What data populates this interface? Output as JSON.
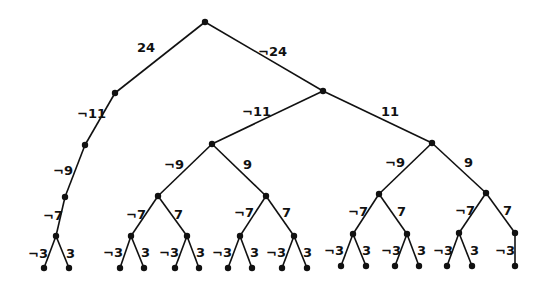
{
  "diagram": {
    "type": "binary-tree",
    "nodes": [
      {
        "id": "root",
        "x": 205,
        "y": 22
      },
      {
        "id": "L",
        "x": 115,
        "y": 93
      },
      {
        "id": "R",
        "x": 323,
        "y": 91
      },
      {
        "id": "L1",
        "x": 85,
        "y": 145
      },
      {
        "id": "L2",
        "x": 65,
        "y": 197
      },
      {
        "id": "L3",
        "x": 56,
        "y": 236
      },
      {
        "id": "L3a",
        "x": 44,
        "y": 268
      },
      {
        "id": "L3b",
        "x": 69,
        "y": 268
      },
      {
        "id": "RA",
        "x": 212,
        "y": 144
      },
      {
        "id": "RB",
        "x": 432,
        "y": 143
      },
      {
        "id": "RA1",
        "x": 158,
        "y": 196
      },
      {
        "id": "RA2",
        "x": 266,
        "y": 196
      },
      {
        "id": "RA1a",
        "x": 131,
        "y": 236
      },
      {
        "id": "RA1b",
        "x": 187,
        "y": 236
      },
      {
        "id": "RA2a",
        "x": 240,
        "y": 236
      },
      {
        "id": "RA2b",
        "x": 294,
        "y": 236
      },
      {
        "id": "RB1",
        "x": 379,
        "y": 194
      },
      {
        "id": "RB2",
        "x": 486,
        "y": 193
      },
      {
        "id": "RB1a",
        "x": 353,
        "y": 234
      },
      {
        "id": "RB1b",
        "x": 407,
        "y": 234
      },
      {
        "id": "RB2a",
        "x": 459,
        "y": 233
      },
      {
        "id": "RB2b",
        "x": 515,
        "y": 233
      },
      {
        "id": "f1",
        "x": 120,
        "y": 268
      },
      {
        "id": "f2",
        "x": 144,
        "y": 268
      },
      {
        "id": "f3",
        "x": 175,
        "y": 268
      },
      {
        "id": "f4",
        "x": 199,
        "y": 268
      },
      {
        "id": "f5",
        "x": 228,
        "y": 268
      },
      {
        "id": "f6",
        "x": 252,
        "y": 268
      },
      {
        "id": "f7",
        "x": 282,
        "y": 268
      },
      {
        "id": "f8",
        "x": 307,
        "y": 268
      },
      {
        "id": "f9",
        "x": 341,
        "y": 266
      },
      {
        "id": "f10",
        "x": 366,
        "y": 266
      },
      {
        "id": "f11",
        "x": 395,
        "y": 266
      },
      {
        "id": "f12",
        "x": 419,
        "y": 266
      },
      {
        "id": "f13",
        "x": 447,
        "y": 266
      },
      {
        "id": "f14",
        "x": 472,
        "y": 266
      },
      {
        "id": "f15",
        "x": 515,
        "y": 266
      }
    ],
    "edges": [
      {
        "from": "root",
        "to": "L",
        "label": "24",
        "lx": 137,
        "ly": 52
      },
      {
        "from": "root",
        "to": "R",
        "label": "¬24",
        "lx": 258,
        "ly": 56
      },
      {
        "from": "L",
        "to": "L1",
        "label": "¬11",
        "lx": 77,
        "ly": 118
      },
      {
        "from": "L1",
        "to": "L2",
        "label": "¬9",
        "lx": 53,
        "ly": 175
      },
      {
        "from": "L2",
        "to": "L3",
        "label": "¬7",
        "lx": 43,
        "ly": 220
      },
      {
        "from": "L3",
        "to": "L3a",
        "label": "¬3",
        "lx": 28,
        "ly": 258
      },
      {
        "from": "L3",
        "to": "L3b",
        "label": "3",
        "lx": 66,
        "ly": 258
      },
      {
        "from": "R",
        "to": "RA",
        "label": "¬11",
        "lx": 242,
        "ly": 116
      },
      {
        "from": "R",
        "to": "RB",
        "label": "11",
        "lx": 381,
        "ly": 116
      },
      {
        "from": "RA",
        "to": "RA1",
        "label": "¬9",
        "lx": 164,
        "ly": 169
      },
      {
        "from": "RA",
        "to": "RA2",
        "label": "9",
        "lx": 243,
        "ly": 169
      },
      {
        "from": "RA1",
        "to": "RA1a",
        "label": "¬7",
        "lx": 126,
        "ly": 219
      },
      {
        "from": "RA1",
        "to": "RA1b",
        "label": "7",
        "lx": 174,
        "ly": 219
      },
      {
        "from": "RA2",
        "to": "RA2a",
        "label": "¬7",
        "lx": 234,
        "ly": 217
      },
      {
        "from": "RA2",
        "to": "RA2b",
        "label": "7",
        "lx": 282,
        "ly": 217
      },
      {
        "from": "RA1a",
        "to": "f1",
        "label": "¬3",
        "lx": 103,
        "ly": 257
      },
      {
        "from": "RA1a",
        "to": "f2",
        "label": "3",
        "lx": 141,
        "ly": 257
      },
      {
        "from": "RA1b",
        "to": "f3",
        "label": "¬3",
        "lx": 159,
        "ly": 257
      },
      {
        "from": "RA1b",
        "to": "f4",
        "label": "3",
        "lx": 196,
        "ly": 257
      },
      {
        "from": "RA2a",
        "to": "f5",
        "label": "¬3",
        "lx": 212,
        "ly": 257
      },
      {
        "from": "RA2a",
        "to": "f6",
        "label": "3",
        "lx": 250,
        "ly": 257
      },
      {
        "from": "RA2b",
        "to": "f7",
        "label": "¬3",
        "lx": 266,
        "ly": 257
      },
      {
        "from": "RA2b",
        "to": "f8",
        "label": "3",
        "lx": 303,
        "ly": 257
      },
      {
        "from": "RB",
        "to": "RB1",
        "label": "¬9",
        "lx": 385,
        "ly": 167
      },
      {
        "from": "RB",
        "to": "RB2",
        "label": "9",
        "lx": 464,
        "ly": 167
      },
      {
        "from": "RB1",
        "to": "RB1a",
        "label": "¬7",
        "lx": 348,
        "ly": 216
      },
      {
        "from": "RB1",
        "to": "RB1b",
        "label": "7",
        "lx": 397,
        "ly": 216
      },
      {
        "from": "RB2",
        "to": "RB2a",
        "label": "¬7",
        "lx": 455,
        "ly": 215
      },
      {
        "from": "RB2",
        "to": "RB2b",
        "label": "7",
        "lx": 503,
        "ly": 215
      },
      {
        "from": "RB1a",
        "to": "f9",
        "label": "¬3",
        "lx": 324,
        "ly": 255
      },
      {
        "from": "RB1a",
        "to": "f10",
        "label": "3",
        "lx": 362,
        "ly": 255
      },
      {
        "from": "RB1b",
        "to": "f11",
        "label": "¬3",
        "lx": 381,
        "ly": 255
      },
      {
        "from": "RB1b",
        "to": "f12",
        "label": "3",
        "lx": 417,
        "ly": 255
      },
      {
        "from": "RB2a",
        "to": "f13",
        "label": "¬3",
        "lx": 433,
        "ly": 255
      },
      {
        "from": "RB2a",
        "to": "f14",
        "label": "3",
        "lx": 470,
        "ly": 255
      },
      {
        "from": "RB2b",
        "to": "f15",
        "label": "¬3",
        "lx": 495,
        "ly": 255
      }
    ]
  }
}
